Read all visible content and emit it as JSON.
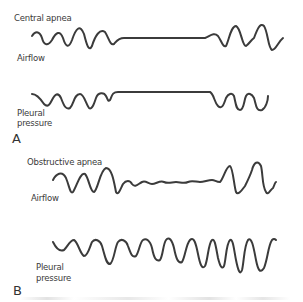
{
  "panels": [
    {
      "letter": "A",
      "title": "Central apnea",
      "traces": [
        {
          "label": "Airflow",
          "pattern": "oscillating breaths, flat line (no airflow), resumed breaths"
        },
        {
          "label_line1": "Pleural",
          "label_line2": "pressure",
          "pattern": "oscillating swings, flat line (no effort), resumed swings"
        }
      ]
    },
    {
      "letter": "B",
      "title": "Obstructive apnea",
      "traces": [
        {
          "label": "Airflow",
          "pattern": "oscillating breaths, reduced near-flat small ripples, large recovery breaths"
        },
        {
          "label_line1": "Pleural",
          "label_line2": "pressure",
          "pattern": "continuous swings of increasing amplitude throughout"
        }
      ]
    }
  ],
  "style": {
    "trace_color": "#3b3b3b",
    "label_color": "#3a3a3a",
    "background": "#ffffff"
  }
}
